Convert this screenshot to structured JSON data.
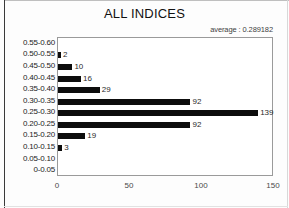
{
  "window": {
    "name": "chart-window"
  },
  "chart_data": {
    "type": "bar",
    "orientation": "horizontal",
    "title": "ALL INDICES",
    "annotation": "average : 0.289182",
    "xlabel": "",
    "ylabel": "",
    "categories": [
      "0.55-0.60",
      "0.50-0.55",
      "0.45-0.50",
      "0.40-0.45",
      "0.35-0.40",
      "0.30-0.35",
      "0.25-0.30",
      "0.20-0.25",
      "0.15-0.20",
      "0.10-0.15",
      "0.05-0.10",
      "0-0.05"
    ],
    "values": [
      0,
      2,
      10,
      16,
      29,
      92,
      139,
      92,
      19,
      3,
      0,
      0
    ],
    "value_labels": [
      "",
      "2",
      "10",
      "16",
      "29",
      "92",
      "139",
      "92",
      "19",
      "3",
      "",
      ""
    ],
    "xlim": [
      0,
      150
    ],
    "xticks": [
      0,
      50,
      100,
      150
    ],
    "xtick_labels": [
      "0",
      "50",
      "100",
      "150"
    ],
    "grid": false,
    "legend": false,
    "bar_color": "#0d0d0d",
    "plot_border_color": "#9a9a9a"
  }
}
